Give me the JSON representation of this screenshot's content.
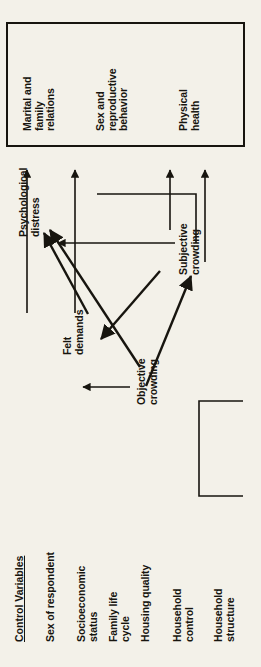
{
  "figure": {
    "orientation": "rotated-90-ccw",
    "background_color": "#f3f1e9",
    "ink_color": "#17150f",
    "outcome_box": {
      "name": "outcome-box",
      "items": [
        {
          "id": "marital-family-relations",
          "label": "Marital and\nfamily\nrelations"
        },
        {
          "id": "sex-reproductive-behavior",
          "label": "Sex and\nreproductive\nbehavior"
        },
        {
          "id": "physical-health",
          "label": "Physical\nhealth"
        }
      ]
    },
    "nodes": [
      {
        "id": "objective-crowding",
        "label": "Objective\ncrowding"
      },
      {
        "id": "felt-demands",
        "label": "Felt\ndemands"
      },
      {
        "id": "subjective-crowding",
        "label": "Subjective\ncrowding"
      },
      {
        "id": "psychological-distress",
        "label": "Psychological\ndistress"
      }
    ],
    "control_variables": {
      "heading": "Control Variables",
      "items": [
        {
          "id": "sex-of-respondent",
          "label": "Sex of respondent"
        },
        {
          "id": "socioeconomic-status",
          "label": "Socioeconomic\nstatus"
        },
        {
          "id": "family-life-cycle",
          "label": "Family life\ncycle"
        },
        {
          "id": "housing-quality",
          "label": "Housing quality"
        },
        {
          "id": "household-control",
          "label": "Household\ncontrol"
        },
        {
          "id": "household-structure",
          "label": "Household\nstructure"
        }
      ]
    },
    "edges": [
      {
        "id": "objective-to-felt",
        "from": "objective-crowding",
        "to": "felt-demands",
        "style": "arrow"
      },
      {
        "id": "objective-to-subjective",
        "from": "objective-crowding",
        "to": "subjective-crowding",
        "style": "arrow"
      },
      {
        "id": "objective-to-distress",
        "from": "objective-crowding",
        "to": "psychological-distress",
        "style": "arrow"
      },
      {
        "id": "felt-to-distress",
        "from": "felt-demands",
        "to": "psychological-distress",
        "style": "arrow"
      },
      {
        "id": "subjective-to-felt",
        "from": "subjective-crowding",
        "to": "felt-demands",
        "style": "arrow"
      },
      {
        "id": "subjective-to-distress",
        "from": "subjective-crowding",
        "to": "psychological-distress",
        "style": "arrow"
      },
      {
        "id": "objective-to-outcomes",
        "from": "objective-crowding",
        "to": "outcome-box",
        "style": "arrow"
      },
      {
        "id": "felt-to-outcomes",
        "from": "felt-demands",
        "to": "outcome-box",
        "style": "arrow"
      },
      {
        "id": "distress-to-outcomes",
        "from": "psychological-distress",
        "to": "outcome-box",
        "style": "arrow"
      },
      {
        "id": "subjective-to-outcomes",
        "from": "subjective-crowding",
        "to": "outcome-box",
        "style": "arrow"
      },
      {
        "id": "controls-bracket",
        "from": "control-variables",
        "to": "model",
        "style": "bracket"
      }
    ]
  }
}
